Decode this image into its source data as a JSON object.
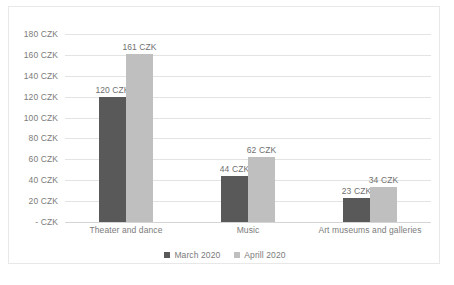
{
  "chart_data": {
    "type": "bar",
    "title": "",
    "xlabel": "",
    "ylabel": "",
    "categories": [
      "Theater and dance",
      "Music",
      "Art museums and galleries"
    ],
    "series": [
      {
        "name": "March 2020",
        "color": "#595959",
        "values": [
          120,
          44,
          23
        ],
        "labels": [
          "120 CZK",
          "44 CZK",
          "23 CZK"
        ]
      },
      {
        "name": "Aprill 2020",
        "color": "#bfbfbf",
        "values": [
          161,
          62,
          34
        ],
        "labels": [
          "161 CZK",
          "62 CZK",
          "34 CZK"
        ]
      }
    ],
    "ylim": [
      0,
      180
    ],
    "ytick_values": [
      180,
      160,
      140,
      120,
      100,
      80,
      60,
      40,
      20,
      0
    ],
    "ytick_labels": [
      "180 CZK",
      "160 CZK",
      "140 CZK",
      "120 CZK",
      "100 CZK",
      "80 CZK",
      "60 CZK",
      "40 CZK",
      "20 CZK",
      "-   CZK"
    ],
    "grid": true,
    "legend_position": "bottom",
    "currency": "CZK"
  },
  "legend": {
    "items": [
      {
        "label": "March 2020",
        "marker": "square-marker-dark"
      },
      {
        "label": "Aprill 2020",
        "marker": "square-marker-light"
      }
    ]
  }
}
